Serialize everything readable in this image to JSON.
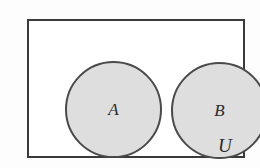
{
  "diagram": {
    "type": "venn-diagram",
    "universe": {
      "label": "U",
      "shape": "rectangle",
      "border_color": "#3a3a3a",
      "fill_color": "#ffffff"
    },
    "sets": [
      {
        "label": "A",
        "shape": "circle",
        "fill_color": "#dedede",
        "border_color": "#4a4a4a"
      },
      {
        "label": "B",
        "shape": "circle",
        "fill_color": "#dedede",
        "border_color": "#4a4a4a"
      }
    ],
    "relationship": "disjoint"
  },
  "colors": {
    "background": "#fdfdfd",
    "set_fill": "#dedede",
    "stroke": "#3a3a3a",
    "text": "#2b2b2b"
  }
}
